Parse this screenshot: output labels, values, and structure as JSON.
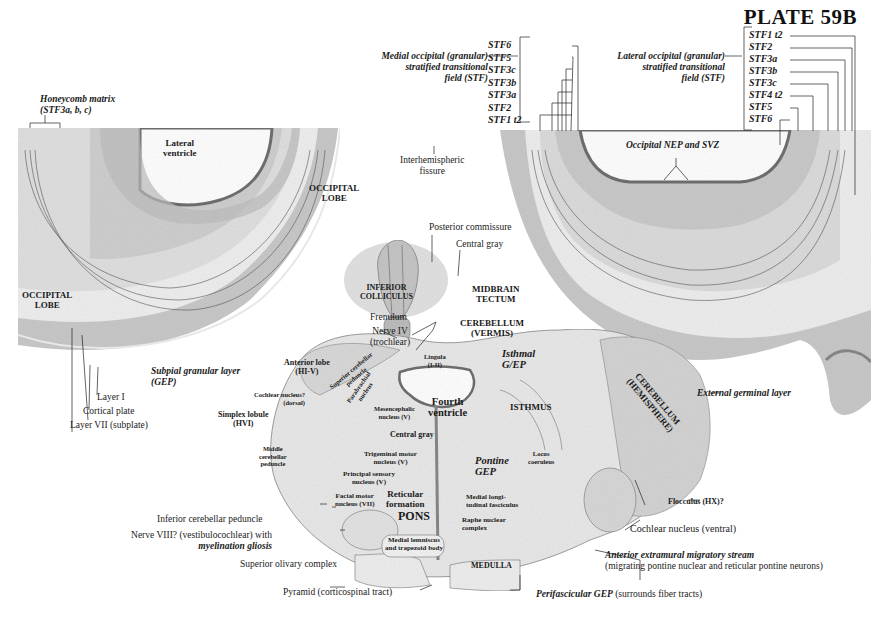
{
  "plate": {
    "title": "PLATE 59B"
  },
  "left_hemisphere": {
    "honeycomb": [
      "Honeycomb matrix",
      "(STF3a, b, c)"
    ],
    "lateral_ventricle": [
      "Lateral",
      "ventricle"
    ],
    "occipital_lobe_upper": [
      "OCCIPITAL",
      "LOBE"
    ],
    "occipital_lobe_lower": [
      "OCCIPITAL",
      "LOBE"
    ],
    "subpial": [
      "Subpial granular layer",
      "(GEP)"
    ],
    "layer_i": "Layer I",
    "cortical_plate": "Cortical plate",
    "layer_vii": "Layer VII (subplate)"
  },
  "center_top": {
    "interhemispheric": [
      "Interhemispheric",
      "fissure"
    ],
    "medial_stf": [
      "Medial occipital (granular)",
      "stratified transitional",
      "field (STF)"
    ],
    "medial_stf_items": [
      "STF6",
      "STF5",
      "STF3c",
      "STF3b",
      "STF3a",
      "STF2",
      "STF1 t2"
    ]
  },
  "right_hemisphere": {
    "lateral_stf": [
      "Lateral occipital (granular)",
      "stratified transitional",
      "field (STF)"
    ],
    "lateral_stf_items": [
      "STF1 t2",
      "STF2",
      "STF3a",
      "STF3b",
      "STF3c",
      "STF4 t2",
      "STF5",
      "STF6"
    ],
    "nep_svz": "Occipital NEP and SVZ"
  },
  "midbrain": {
    "posterior_commissure": "Posterior commissure",
    "central_gray": "Central gray",
    "inferior_colliculus": [
      "INFERIOR",
      "COLLICULUS"
    ],
    "midbrain_tectum": [
      "MIDBRAIN",
      "TECTUM"
    ],
    "frenulum": "Frenulum",
    "nerve_iv": [
      "Nerve IV",
      "(trochlear)"
    ],
    "cerebellum_vermis": [
      "CEREBELLUM",
      "(VERMIS)"
    ],
    "lingula": [
      "Lingula",
      "(I-II)"
    ]
  },
  "pons": {
    "anterior_lobe": [
      "Anterior lobe",
      "(HI-V)"
    ],
    "cochlear_dorsal": [
      "Cochlear nucleus?",
      "(dorsal)"
    ],
    "simplex": [
      "Simplex lobule",
      "(HVI)"
    ],
    "middle_peduncle": [
      "Middle",
      "cerebellar",
      "peduncle"
    ],
    "superior_peduncle": [
      "Superior cerebellar",
      "peduncle"
    ],
    "parabrachial": [
      "Parabrachial",
      "nucleus"
    ],
    "mesencephalic": [
      "Mesencephalic",
      "nucleus (V)"
    ],
    "fourth_ventricle": [
      "Fourth",
      "ventricle"
    ],
    "central_gray": "Central gray",
    "isthmal_gep": [
      "Isthmal",
      "G/EP"
    ],
    "isthmus": "ISTHMUS",
    "trigeminal_motor": [
      "Trigeminal motor",
      "nucleus (V)"
    ],
    "principal_sensory": [
      "Principal sensory",
      "nucleus (V)"
    ],
    "facial_motor": [
      "Facial motor",
      "nucleus (VII)"
    ],
    "reticular": [
      "Reticular",
      "formation"
    ],
    "pons_label": "PONS",
    "pontine_gep": [
      "Pontine",
      "GEP"
    ],
    "locus_coeruleus": [
      "Locus",
      "coeruleus"
    ],
    "medial_longitudinal": [
      "Medial longi-",
      "tudinal fasciculus"
    ],
    "raphe": [
      "Raphe nuclear",
      "complex"
    ],
    "medial_lemniscus": [
      "Medial lemniscus",
      "and trapezoid body"
    ],
    "medulla": "MEDULLA",
    "cerebellum_hemisphere": [
      "CEREBELLUM",
      "(HEMISPHERE)"
    ]
  },
  "outer_labels": {
    "external_germinal": "External germinal layer",
    "flocculus": "Flocculus (HX)?",
    "cochlear_ventral": "Cochlear nucleus (ventral)",
    "anterior_stream": "Anterior extramural migratory stream",
    "anterior_stream_sub": "(migrating pontine nuclear and reticular pontine neurons)",
    "inferior_peduncle": "Inferior cerebellar peduncle",
    "nerve_viii": "Nerve VIII? (vestibulocochlear) with",
    "myelination": "myelination gliosis",
    "superior_olivary": "Superior olivary complex",
    "pyramid": "Pyramid (corticospinal tract)",
    "perifascicular": "Perifascicular GEP",
    "perifascicular_sub": "(surrounds fiber tracts)"
  },
  "colors": {
    "tissue_light": "#ececec",
    "tissue_mid": "#d2d2d2",
    "tissue_dark": "#a9a9a9",
    "ventricle_edge": "#7a7a7a",
    "line": "#333333"
  }
}
